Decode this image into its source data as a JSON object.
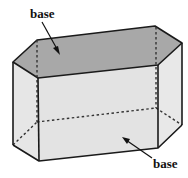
{
  "figure": {
    "labels": {
      "top_base": "base",
      "bottom_base": "base"
    },
    "colors": {
      "top_face": "#a8a8a8",
      "side_faces": "#e3e3e3",
      "edges": "#1a1a1a",
      "hidden_edges": "#333333"
    }
  }
}
